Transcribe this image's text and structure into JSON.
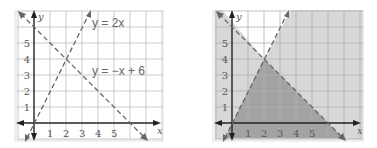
{
  "left_graph": {
    "title": "Boundary lines",
    "equations": [
      {
        "label": "y = 2x",
        "slope": 2,
        "intercept": 0,
        "style": "dashed"
      },
      {
        "label": "y = −x + 6",
        "slope": -1,
        "intercept": 6,
        "style": "dashed"
      }
    ],
    "x_axis_label": "x",
    "y_axis_label": "y",
    "x_ticks": [
      "1",
      "2",
      "3",
      "4",
      "5"
    ],
    "y_ticks": [
      "1",
      "2",
      "3",
      "4",
      "5"
    ],
    "intersection": [
      2,
      4
    ]
  },
  "right_graph": {
    "title": "Shaded solution region",
    "x_axis_label": "x",
    "y_axis_label": "y",
    "x_ticks": [
      "1",
      "2",
      "3",
      "4",
      "5"
    ],
    "y_ticks": [
      "1",
      "2",
      "3",
      "4",
      "5"
    ],
    "shading": {
      "light": "#d8d8d8",
      "dark": "#9e9e9e",
      "unshaded": "#ffffff"
    },
    "solution_region_vertices": [
      [
        0,
        0
      ],
      [
        2,
        4
      ],
      [
        6,
        0
      ]
    ]
  },
  "colors": {
    "grid": "#b8b8b8",
    "axis": "#222222",
    "dash": "#666666",
    "tick_label": "#555555",
    "frame_shadow": "#cfcfcf"
  }
}
